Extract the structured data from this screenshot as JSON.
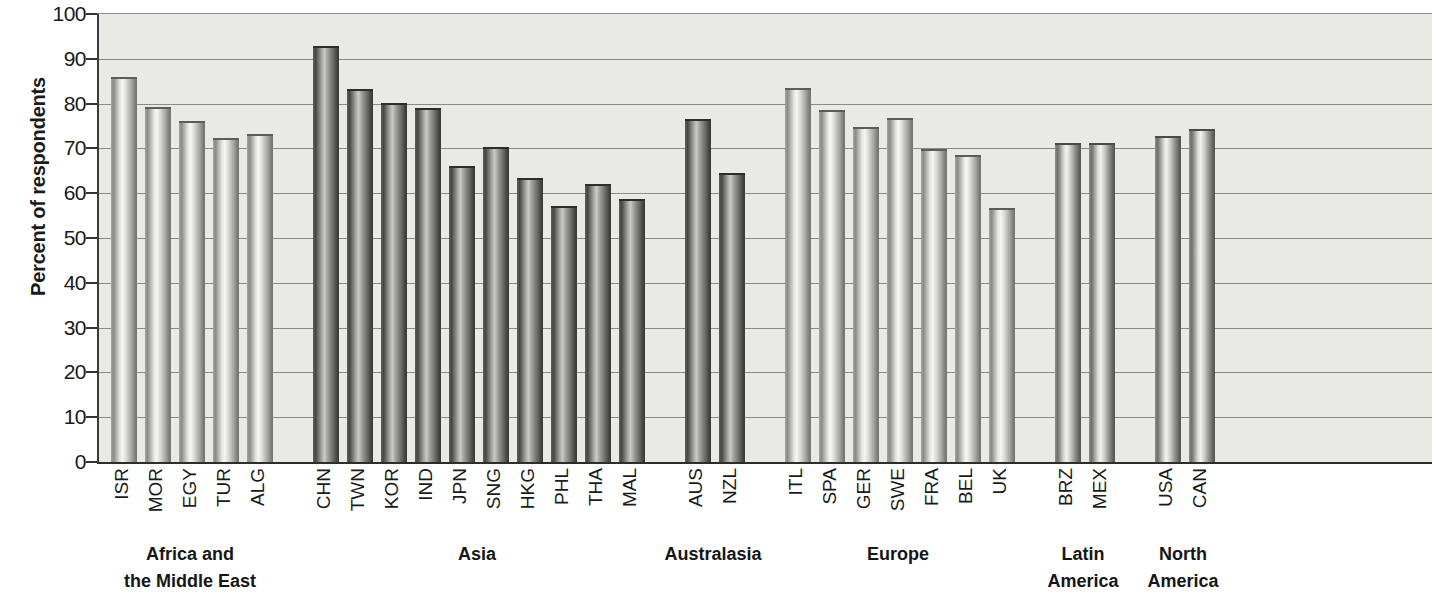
{
  "chart_data": {
    "type": "bar",
    "title": "",
    "xlabel": "",
    "ylabel": "Percent of respondents",
    "ylim": [
      0,
      100
    ],
    "ytick_step": 10,
    "yticks": [
      100,
      90,
      80,
      70,
      60,
      50,
      40,
      30,
      20,
      10,
      0
    ],
    "grid": "horizontal",
    "legend": "none",
    "plot_background": "#e9e9e6",
    "bar_style": "cylindrical-gradient-grayscale",
    "groups": [
      {
        "name": "Africa and the Middle East",
        "label_lines": [
          "Africa and",
          "the Middle East"
        ],
        "shade": "light",
        "categories": [
          "ISR",
          "MOR",
          "EGY",
          "TUR",
          "ALG"
        ],
        "values": [
          86.0,
          79.3,
          76.2,
          72.4,
          73.3
        ]
      },
      {
        "name": "Asia",
        "label_lines": [
          "Asia",
          ""
        ],
        "shade": "dark",
        "categories": [
          "CHN",
          "TWN",
          "KOR",
          "IND",
          "JPN",
          "SNG",
          "HKG",
          "PHL",
          "THA",
          "MAL"
        ],
        "values": [
          92.8,
          83.3,
          80.2,
          79.0,
          66.0,
          70.4,
          63.3,
          57.1,
          62.1,
          58.6
        ]
      },
      {
        "name": "Australasia",
        "label_lines": [
          "Australasia",
          ""
        ],
        "shade": "dark",
        "categories": [
          "AUS",
          "NZL"
        ],
        "values": [
          76.6,
          64.6
        ]
      },
      {
        "name": "Europe",
        "label_lines": [
          "Europe",
          ""
        ],
        "shade": "light",
        "categories": [
          "ITL",
          "SPA",
          "GER",
          "SWE",
          "FRA",
          "BEL",
          "UK"
        ],
        "values": [
          83.4,
          78.6,
          74.8,
          76.8,
          69.8,
          68.5,
          56.7
        ]
      },
      {
        "name": "Latin America",
        "label_lines": [
          "Latin",
          "America"
        ],
        "shade": "normal",
        "categories": [
          "BRZ",
          "MEX"
        ],
        "values": [
          71.1,
          71.3
        ]
      },
      {
        "name": "North America",
        "label_lines": [
          "North",
          "America"
        ],
        "shade": "normal",
        "categories": [
          "USA",
          "CAN"
        ],
        "values": [
          72.7,
          74.4
        ]
      }
    ]
  }
}
